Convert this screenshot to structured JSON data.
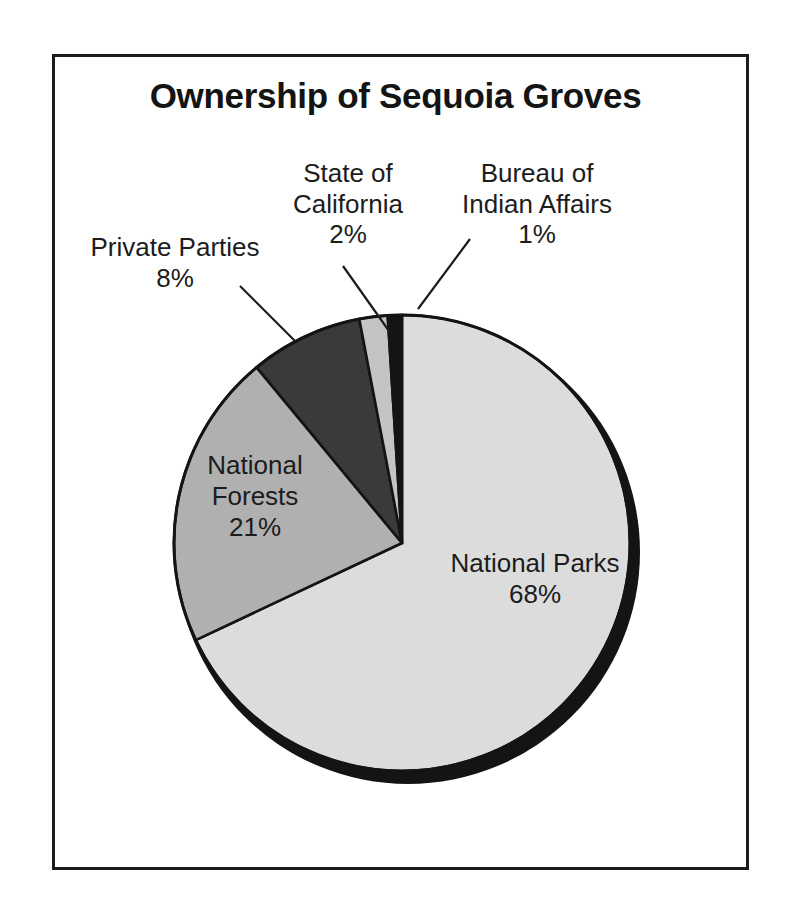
{
  "chart_data": {
    "type": "pie",
    "title": "Ownership of Sequoia Groves",
    "xlabel": "",
    "ylabel": "",
    "unit": "%",
    "legend_position": "none",
    "grid": false,
    "labels_inside_slices": [
      "National Parks",
      "National Forests"
    ],
    "labels_with_leader_lines": [
      "Private Parties",
      "State of California",
      "Bureau of Indian Affairs"
    ],
    "start_angle_deg": 0,
    "direction": "clockwise",
    "categories": [
      "National Parks",
      "National Forests",
      "Private Parties",
      "State of California",
      "Bureau of Indian Affairs"
    ],
    "values": [
      68,
      21,
      8,
      2,
      1
    ],
    "slices": [
      {
        "name": "National Parks",
        "value": 68,
        "value_text": "68%",
        "color": "#dcdcdc"
      },
      {
        "name": "National Forests",
        "value": 21,
        "value_text": "21%",
        "color": "#b0b0b0"
      },
      {
        "name": "Private Parties",
        "value": 8,
        "value_text": "8%",
        "color": "#3a3a3a"
      },
      {
        "name": "State of California",
        "value": 2,
        "value_text": "2%",
        "color": "#c4c4c4"
      },
      {
        "name": "Bureau of Indian Affairs",
        "value": 1,
        "value_text": "1%",
        "color": "#141414"
      }
    ]
  },
  "title": "Ownership of Sequoia Groves",
  "callouts": {
    "private": {
      "line1": "Private Parties",
      "pct": "8%"
    },
    "state": {
      "line1": "State of",
      "line2": "California",
      "pct": "2%"
    },
    "bia": {
      "line1": "Bureau of",
      "line2": "Indian Affairs",
      "pct": "1%"
    }
  },
  "slice_labels": {
    "forests": {
      "line1": "National",
      "line2": "Forests",
      "pct": "21%"
    },
    "parks": {
      "line1": "National Parks",
      "pct": "68%"
    }
  },
  "colors": {
    "frame": "#1c1c1c",
    "text": "#1c1c1c",
    "background": "#ffffff",
    "shadow": "#141414",
    "outline": "#141414"
  }
}
